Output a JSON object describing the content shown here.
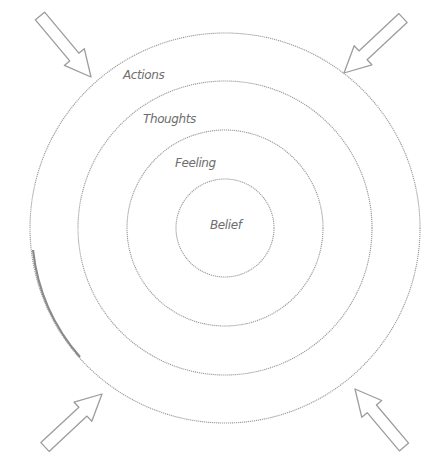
{
  "diagram": {
    "type": "concentric-circles",
    "center": {
      "x": 225,
      "y": 228
    },
    "colors": {
      "stroke": "#9a9a9a",
      "text": "#6e6e6e",
      "background": "#ffffff"
    },
    "rings": [
      {
        "label": "Actions",
        "radius": 195,
        "label_pos": {
          "x": 123,
          "y": 79
        }
      },
      {
        "label": "Thoughts",
        "radius": 147,
        "label_pos": {
          "x": 143,
          "y": 123
        }
      },
      {
        "label": "Feeling",
        "radius": 98,
        "label_pos": {
          "x": 175,
          "y": 167
        }
      },
      {
        "label": "Belief",
        "radius": 49,
        "label_pos": {
          "x": 210,
          "y": 229
        }
      }
    ],
    "arrows": [
      {
        "name": "top-left",
        "tail": [
          40,
          16
        ],
        "tip": [
          91,
          77
        ]
      },
      {
        "name": "top-right",
        "tail": [
          403,
          18
        ],
        "tip": [
          344,
          73
        ]
      },
      {
        "name": "bottom-left",
        "tail": [
          45,
          447
        ],
        "tip": [
          102,
          394
        ]
      },
      {
        "name": "bottom-right",
        "tail": [
          404,
          447
        ],
        "tip": [
          355,
          389
        ]
      }
    ]
  }
}
